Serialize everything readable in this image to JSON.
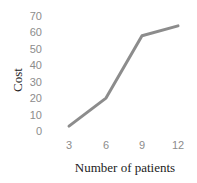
{
  "chart_data": {
    "type": "line",
    "title": "",
    "xlabel": "Number of patients",
    "ylabel": "Cost",
    "categories": [
      "3",
      "6",
      "9",
      "12"
    ],
    "x": [
      3,
      6,
      9,
      12
    ],
    "values": [
      3,
      20,
      58,
      64
    ],
    "series": [
      {
        "name": "Cost",
        "values": [
          3,
          20,
          58,
          64
        ],
        "color": "#8c8c8c"
      }
    ],
    "yticks": [
      "0",
      "10",
      "20",
      "30",
      "40",
      "50",
      "60",
      "70"
    ],
    "ylim": [
      0,
      70
    ],
    "grid": false,
    "legend": null
  }
}
